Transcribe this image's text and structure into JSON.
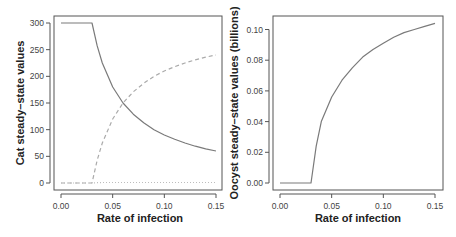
{
  "chart_data": [
    {
      "type": "line",
      "title": "",
      "xlabel": "Rate of infection",
      "ylabel": "Cat steady–state values",
      "xlim": [
        0.0,
        0.15
      ],
      "ylim": [
        0,
        300
      ],
      "xticks": [
        "0.00",
        "0.05",
        "0.10",
        "0.15"
      ],
      "yticks": [
        "0",
        "50",
        "100",
        "150",
        "200",
        "250",
        "300"
      ],
      "grid": false,
      "legend": null,
      "x": [
        0.0,
        0.02,
        0.03,
        0.035,
        0.04,
        0.05,
        0.06,
        0.07,
        0.08,
        0.09,
        0.1,
        0.11,
        0.12,
        0.13,
        0.14,
        0.15
      ],
      "series": [
        {
          "name": "susceptible (solid)",
          "style": "solid",
          "values": [
            300,
            300,
            300,
            257,
            225,
            180,
            150,
            129,
            113,
            100,
            90,
            82,
            75,
            69,
            64,
            60
          ]
        },
        {
          "name": "infected (dashed)",
          "style": "dashed",
          "values": [
            0,
            0,
            0,
            43,
            75,
            120,
            150,
            171,
            187,
            200,
            210,
            218,
            225,
            231,
            236,
            240
          ]
        },
        {
          "name": "other (dotted)",
          "style": "dotted",
          "values": [
            0,
            0,
            0,
            0.5,
            1,
            1,
            1,
            1,
            1,
            1,
            1,
            1,
            1,
            1,
            1,
            1
          ]
        }
      ]
    },
    {
      "type": "line",
      "title": "",
      "xlabel": "Rate of infection",
      "ylabel": "Oocyst steady–state values (billions)",
      "xlim": [
        0.0,
        0.15
      ],
      "ylim": [
        0.0,
        0.1
      ],
      "xticks": [
        "0.00",
        "0.05",
        "0.10",
        "0.15"
      ],
      "yticks": [
        "0.00",
        "0.02",
        "0.04",
        "0.06",
        "0.08",
        "0.10"
      ],
      "grid": false,
      "legend": null,
      "x": [
        0.0,
        0.02,
        0.03,
        0.035,
        0.04,
        0.05,
        0.06,
        0.07,
        0.08,
        0.09,
        0.1,
        0.11,
        0.12,
        0.13,
        0.14,
        0.15
      ],
      "series": [
        {
          "name": "oocysts",
          "style": "solid",
          "values": [
            0.0,
            0.0,
            0.0,
            0.024,
            0.04,
            0.056,
            0.067,
            0.075,
            0.082,
            0.087,
            0.091,
            0.095,
            0.098,
            0.1,
            0.102,
            0.104
          ]
        }
      ]
    }
  ]
}
